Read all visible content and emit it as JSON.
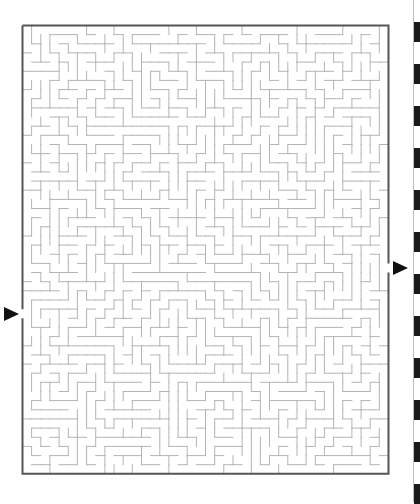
{
  "puzzle": {
    "type": "maze",
    "cols": 40,
    "rows": 49,
    "cell_px": 9.15,
    "origin": {
      "x": 22.5,
      "y": 25.5
    },
    "seed": 7321,
    "colors": {
      "wall": "#b4b4b4",
      "border": "#555555",
      "arrow": "#111111",
      "stripe": "#1a1a1a"
    },
    "entrance": {
      "side": "left",
      "row": 31,
      "label": "start-arrow"
    },
    "exit": {
      "side": "right",
      "row": 26,
      "label": "finish-arrow"
    }
  },
  "edge_stripes": {
    "start_y": 22,
    "period": 42,
    "black_height": 20,
    "count": 12
  }
}
